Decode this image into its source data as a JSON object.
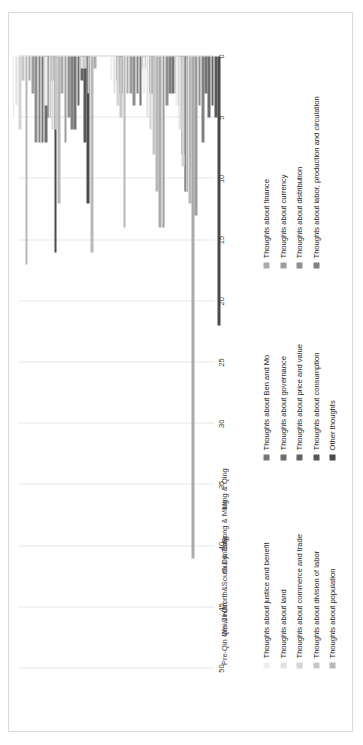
{
  "chart_data": {
    "type": "bar",
    "orientation": "horizontal-rotated",
    "title": "",
    "xlabel": "",
    "ylabel": "",
    "ylim": [
      0,
      50
    ],
    "grid": true,
    "legend_position": "bottom",
    "tick_labels": [
      "0",
      "5",
      "10",
      "15",
      "20",
      "25",
      "30",
      "35",
      "40",
      "45",
      "50"
    ],
    "tick_values": [
      0,
      5,
      10,
      15,
      20,
      25,
      30,
      35,
      40,
      45,
      50
    ],
    "categories": [
      "Pre-Qin",
      "Qin & Han",
      "Wei,Jin,North&South Dynasty",
      "Sui & Tang",
      "Song & Ming",
      "Ming & Qing"
    ],
    "series": [
      {
        "name": "Thoughts about justice and benefit",
        "color": "#efefef",
        "values": [
          5,
          4,
          0,
          2,
          3,
          4
        ]
      },
      {
        "name": "Thoughts about land",
        "color": "#e2e2e2",
        "values": [
          4,
          5,
          1,
          3,
          5,
          6
        ]
      },
      {
        "name": "Thoughts about commerce and trade",
        "color": "#d4d4d4",
        "values": [
          6,
          6,
          1,
          4,
          6,
          9
        ]
      },
      {
        "name": "Thoughts about division of labor",
        "color": "#c7c7c7",
        "values": [
          2,
          6,
          3,
          5,
          8,
          11
        ]
      },
      {
        "name": "Thoughts about population",
        "color": "#b8b8b8",
        "values": [
          17,
          12,
          16,
          14,
          11,
          12
        ]
      },
      {
        "name": "Thoughts about finance",
        "color": "#ababab",
        "values": [
          2,
          3,
          1,
          3,
          14,
          41
        ]
      },
      {
        "name": "Thoughts about currency",
        "color": "#9d9d9d",
        "values": [
          3,
          7,
          0,
          3,
          14,
          13
        ]
      },
      {
        "name": "Thoughts about distribution",
        "color": "#8f8f8f",
        "values": [
          7,
          5,
          0,
          4,
          4,
          4
        ]
      },
      {
        "name": "Thoughts about labor, production and circulation",
        "color": "#818181",
        "values": [
          7,
          6,
          0,
          3,
          3,
          7
        ]
      },
      {
        "name": "Thoughts about Ben and Mo",
        "color": "#757575",
        "values": [
          7,
          6,
          0,
          4,
          3,
          3
        ]
      },
      {
        "name": "Thoughts about governance",
        "color": "#6d6d6d",
        "values": [
          7,
          4,
          0,
          1,
          3,
          5
        ]
      },
      {
        "name": "Thoughts about price and value",
        "color": "#636363",
        "values": [
          5,
          2,
          0,
          0,
          4,
          4
        ]
      },
      {
        "name": "Thoughts about consumption",
        "color": "#575757",
        "values": [
          2,
          7,
          2,
          3,
          8,
          5
        ]
      },
      {
        "name": "Other thoughts",
        "color": "#4a4a4a",
        "values": [
          16,
          12,
          3,
          3,
          11,
          22
        ]
      }
    ]
  },
  "legend": {
    "column_one": [
      "Thoughts about justice and benefit",
      "Thoughts about land",
      "Thoughts about commerce and trade",
      "Thoughts about division of labor",
      "Thoughts about population"
    ],
    "column_two": [
      "Thoughts about Ben and Mo",
      "Thoughts about governance",
      "Thoughts about price and value",
      "Thoughts about consumption",
      "Other thoughts"
    ],
    "column_three": [
      "Thoughts about finance",
      "Thoughts about currency",
      "Thoughts about distribution",
      "Thoughts about labor, production and circulation"
    ],
    "column_one_colors": [
      "#efefef",
      "#e2e2e2",
      "#d4d4d4",
      "#c7c7c7",
      "#b8b8b8"
    ],
    "column_two_colors": [
      "#757575",
      "#6d6d6d",
      "#636363",
      "#575757",
      "#4a4a4a"
    ],
    "column_three_colors": [
      "#ababab",
      "#9d9d9d",
      "#8f8f8f",
      "#818181"
    ]
  }
}
